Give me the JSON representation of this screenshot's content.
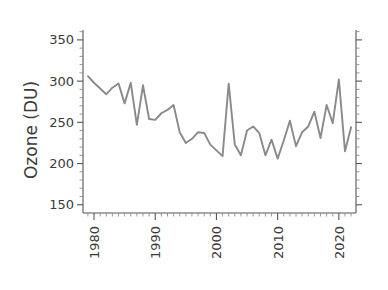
{
  "chart_data": {
    "type": "line",
    "title": "",
    "xlabel": "",
    "ylabel": "Ozone (DU)",
    "xlim": [
      1978.2,
      1978.2
    ],
    "ylim": [
      140,
      362
    ],
    "grid": false,
    "legend": "none",
    "line_color": "#8a8a8a",
    "axis_color": "#555555",
    "text_color": "#3a3a3a",
    "y_ticks_major": [
      150,
      200,
      250,
      300,
      350
    ],
    "y_ticks_minor": [
      160,
      170,
      180,
      190,
      210,
      220,
      230,
      240,
      260,
      270,
      280,
      290,
      310,
      320,
      330,
      340,
      360
    ],
    "y_tick_labels": [
      "150",
      "200",
      "250",
      "300",
      "350"
    ],
    "x_ticks_major": [
      1980,
      1990,
      2000,
      2010,
      2020
    ],
    "x_tick_labels": [
      "1980",
      "1990",
      "2000",
      "2010",
      "2020"
    ],
    "x_ticks_minor": [
      1979,
      1981,
      1982,
      1983,
      1984,
      1985,
      1986,
      1987,
      1988,
      1989,
      1991,
      1992,
      1993,
      1994,
      1995,
      1996,
      1997,
      1998,
      1999,
      2001,
      2002,
      2003,
      2004,
      2005,
      2006,
      2007,
      2008,
      2009,
      2011,
      2012,
      2013,
      2014,
      2015,
      2016,
      2017,
      2018,
      2019,
      2021,
      2022
    ],
    "x": [
      1979,
      1980,
      1981,
      1982,
      1983,
      1984,
      1985,
      1986,
      1987,
      1988,
      1989,
      1990,
      1991,
      1992,
      1993,
      1994,
      1995,
      1996,
      1997,
      1998,
      1999,
      2000,
      2001,
      2002,
      2003,
      2004,
      2005,
      2006,
      2007,
      2008,
      2009,
      2010,
      2011,
      2012,
      2013,
      2014,
      2015,
      2016,
      2017,
      2018,
      2019,
      2020,
      2021,
      2022
    ],
    "values": [
      306,
      298,
      291,
      284,
      292,
      297,
      273,
      298,
      247,
      295,
      254,
      253,
      261,
      265,
      271,
      238,
      225,
      230,
      238,
      237,
      223,
      216,
      209,
      297,
      223,
      210,
      240,
      245,
      237,
      210,
      229,
      206,
      228,
      252,
      221,
      238,
      245,
      263,
      231,
      271,
      249,
      302,
      215,
      244
    ],
    "annotations": []
  },
  "axes": {
    "y_axis_title": "Ozone (DU)",
    "right_axis_present": true,
    "top_axis_present": false
  }
}
